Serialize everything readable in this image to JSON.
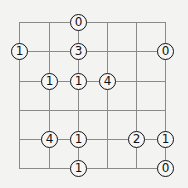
{
  "puzzle": {
    "type": "bridges-clue-grid",
    "cols": 6,
    "rows": 6,
    "grid_x": [
      19,
      49,
      78,
      107,
      136,
      165
    ],
    "grid_y": [
      22,
      51,
      81,
      110,
      139,
      168
    ],
    "line_color": "#8a8a8a",
    "background_color": "#f3f3f2",
    "clues": [
      {
        "col": 2,
        "row": 0,
        "value": "0"
      },
      {
        "col": 0,
        "row": 1,
        "value": "1"
      },
      {
        "col": 2,
        "row": 1,
        "value": "3"
      },
      {
        "col": 5,
        "row": 1,
        "value": "0"
      },
      {
        "col": 1,
        "row": 2,
        "value": "1"
      },
      {
        "col": 2,
        "row": 2,
        "value": "1"
      },
      {
        "col": 3,
        "row": 2,
        "value": "4"
      },
      {
        "col": 1,
        "row": 4,
        "value": "4"
      },
      {
        "col": 2,
        "row": 4,
        "value": "1"
      },
      {
        "col": 4,
        "row": 4,
        "value": "2"
      },
      {
        "col": 5,
        "row": 4,
        "value": "1"
      },
      {
        "col": 2,
        "row": 5,
        "value": "1"
      },
      {
        "col": 5,
        "row": 5,
        "value": "0"
      }
    ]
  }
}
